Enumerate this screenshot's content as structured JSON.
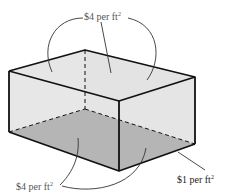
{
  "diagram": {
    "type": "rectangular box (open-top container) cost diagram",
    "labels": {
      "top": {
        "text": "$4 per ft",
        "sup": "2"
      },
      "bottom_left": {
        "text": "$4 per ft",
        "sup": "2"
      },
      "bottom_right": {
        "text": "$1 per ft",
        "sup": "2"
      }
    },
    "colors": {
      "edge": "#111111",
      "side_fill": "#e6e6e6",
      "base_fill": "#9a9a9a",
      "leader": "#333333",
      "label_text": "#555555"
    }
  }
}
